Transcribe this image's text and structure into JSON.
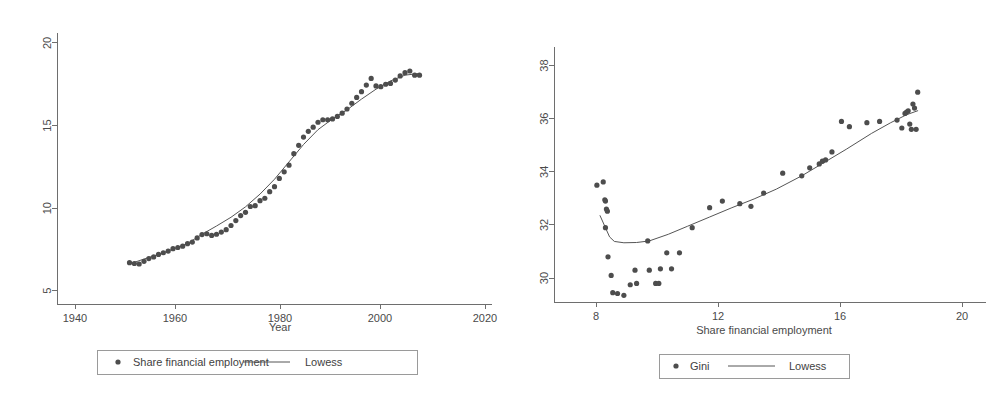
{
  "figure": {
    "background": "#ffffff",
    "marker_color": "#4d4d4d",
    "line_color": "#555555",
    "axis_color": "#6e6e6e"
  },
  "chart_data": [
    {
      "id": "left",
      "type": "scatter",
      "title": "",
      "xlabel": "Year",
      "ylabel": "",
      "xlim": [
        1935,
        2025
      ],
      "ylim": [
        4.2,
        20.6
      ],
      "xticks": [
        1940,
        1960,
        1980,
        2000,
        2020
      ],
      "xticklabels": [
        "1940",
        "1960",
        "1980",
        "2000",
        "2020"
      ],
      "yticks": [
        5,
        10,
        15,
        20
      ],
      "yticklabels": [
        "5",
        "10",
        "15",
        "20"
      ],
      "grid": false,
      "legend_position": "below",
      "legend": [
        {
          "label": "Share financial employment",
          "marker": "dot"
        },
        {
          "label": "Lowess",
          "marker": "line"
        }
      ],
      "series": [
        {
          "name": "Share financial employment",
          "marker": "dot",
          "x": [
            1950,
            1951,
            1952,
            1953,
            1954,
            1955,
            1956,
            1957,
            1958,
            1959,
            1960,
            1961,
            1962,
            1963,
            1964,
            1965,
            1966,
            1967,
            1968,
            1969,
            1970,
            1971,
            1972,
            1973,
            1974,
            1975,
            1976,
            1977,
            1978,
            1979,
            1980,
            1981,
            1982,
            1983,
            1984,
            1985,
            1986,
            1987,
            1988,
            1989,
            1990,
            1991,
            1992,
            1993,
            1994,
            1995,
            1996,
            1997,
            1998,
            1999,
            2000,
            2001,
            2002,
            2003,
            2004,
            2005,
            2006,
            2007,
            2008,
            2009,
            2010
          ],
          "y": [
            6.7,
            6.65,
            6.62,
            6.78,
            6.95,
            7.05,
            7.2,
            7.3,
            7.4,
            7.55,
            7.62,
            7.7,
            7.85,
            7.95,
            8.2,
            8.4,
            8.45,
            8.35,
            8.42,
            8.55,
            8.7,
            8.95,
            9.25,
            9.55,
            9.75,
            10.1,
            10.15,
            10.45,
            10.6,
            11.0,
            11.3,
            11.8,
            12.2,
            12.6,
            13.3,
            13.8,
            14.3,
            14.65,
            14.9,
            15.2,
            15.35,
            15.35,
            15.4,
            15.55,
            15.75,
            16.0,
            16.35,
            16.7,
            17.05,
            17.45,
            17.85,
            17.4,
            17.35,
            17.5,
            17.55,
            17.75,
            18.0,
            18.2,
            18.3,
            18.05,
            18.05
          ]
        }
      ],
      "lowess": {
        "name": "Lowess",
        "x": [
          1950,
          1953,
          1956,
          1959,
          1962,
          1965,
          1968,
          1971,
          1974,
          1977,
          1980,
          1983,
          1986,
          1989,
          1992,
          1995,
          1998,
          2001,
          2004,
          2007,
          2010
        ],
        "y": [
          6.62,
          6.92,
          7.2,
          7.52,
          7.86,
          8.42,
          8.92,
          9.45,
          10.08,
          10.85,
          11.75,
          12.8,
          13.85,
          14.75,
          15.4,
          15.95,
          16.6,
          17.2,
          17.7,
          18.05,
          18.15
        ]
      }
    },
    {
      "id": "right",
      "type": "scatter",
      "title": "",
      "xlabel": "Share financial employment",
      "ylabel": "",
      "xlim": [
        7.0,
        20.6
      ],
      "ylim": [
        29.1,
        38.7
      ],
      "xticks": [
        8,
        12,
        16,
        20
      ],
      "xticklabels": [
        "8",
        "12",
        "16",
        "20"
      ],
      "yticks": [
        30,
        32,
        34,
        36,
        38
      ],
      "yticklabels": [
        "30",
        "32",
        "34",
        "36",
        "38"
      ],
      "grid": false,
      "legend_position": "below",
      "legend": [
        {
          "label": "Gini",
          "marker": "dot"
        },
        {
          "label": "Lowess",
          "marker": "line"
        }
      ],
      "series": [
        {
          "name": "Gini",
          "marker": "dot",
          "x": [
            8.35,
            8.55,
            8.6,
            8.62,
            8.65,
            8.68,
            8.62,
            8.7,
            8.8,
            8.85,
            9.0,
            9.2,
            9.4,
            9.55,
            9.6,
            9.95,
            10.0,
            10.2,
            10.3,
            10.35,
            10.55,
            10.7,
            10.95,
            11.35,
            11.9,
            12.3,
            12.85,
            13.2,
            13.6,
            14.2,
            14.8,
            15.05,
            15.35,
            15.45,
            15.55,
            15.75,
            16.05,
            16.3,
            16.85,
            17.25,
            17.8,
            17.95,
            18.05,
            18.1,
            18.15,
            18.2,
            18.25,
            18.3,
            18.35,
            18.4,
            18.45
          ],
          "y": [
            33.5,
            33.62,
            32.95,
            32.9,
            32.6,
            32.52,
            31.9,
            30.8,
            30.1,
            29.45,
            29.42,
            29.35,
            29.75,
            30.3,
            29.8,
            31.4,
            30.3,
            29.8,
            29.8,
            30.35,
            30.95,
            30.35,
            30.95,
            31.9,
            32.65,
            32.9,
            32.8,
            32.7,
            33.2,
            33.95,
            33.85,
            34.15,
            34.3,
            34.4,
            34.45,
            34.75,
            35.9,
            35.7,
            35.85,
            35.9,
            35.95,
            35.65,
            36.2,
            36.25,
            36.3,
            35.8,
            35.6,
            36.55,
            36.4,
            35.6,
            37.0
          ]
        }
      ],
      "lowess": {
        "name": "Lowess",
        "x": [
          8.45,
          8.6,
          8.75,
          8.9,
          9.2,
          9.6,
          10.0,
          10.6,
          11.2,
          11.9,
          12.6,
          13.3,
          14.0,
          14.8,
          15.5,
          16.2,
          17.0,
          17.6,
          18.1,
          18.45
        ],
        "y": [
          32.35,
          31.95,
          31.55,
          31.38,
          31.33,
          31.34,
          31.4,
          31.65,
          31.95,
          32.3,
          32.65,
          32.98,
          33.35,
          33.85,
          34.35,
          34.85,
          35.45,
          35.85,
          36.15,
          36.3
        ]
      }
    }
  ]
}
